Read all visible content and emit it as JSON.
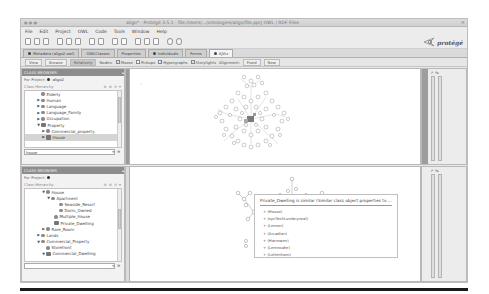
{
  "window": {
    "title": "aligo* · Protégé 3.5.1 · file:/Users/.../ontologies/aligo/file.pprj   OWL / RDF Files",
    "close_glyph": "×",
    "wm_buttons": "● ● ●"
  },
  "menubar": {
    "items": [
      "File",
      "Edit",
      "Project",
      "OWL",
      "Code",
      "Tools",
      "Window",
      "Help"
    ]
  },
  "toolbar": {
    "icons": [
      "new-file-icon",
      "open-folder-icon",
      "save-icon",
      "cut-icon",
      "copy-icon",
      "paste-icon",
      "undo-icon",
      "redo-icon",
      "find-icon",
      "find-next-icon",
      "class-icon",
      "property-icon",
      "individual-icon",
      "back-icon",
      "forward-icon"
    ],
    "logo_text": "protégé"
  },
  "tabs": [
    {
      "label": "Metadata (aligo2.owl)",
      "icon": true,
      "active": false
    },
    {
      "label": "OWLClasses",
      "icon": false,
      "active": false
    },
    {
      "label": "Properties",
      "icon": false,
      "active": false
    },
    {
      "label": "Individuals",
      "icon": true,
      "active": false
    },
    {
      "label": "Forms",
      "icon": false,
      "active": false
    },
    {
      "label": "AJViz",
      "icon": true,
      "active": true
    }
  ],
  "options": {
    "view_btn": "View",
    "browse_btn": "Browse",
    "relatively_btn": "Relatively",
    "nodes_label": "Nodes:",
    "checks": [
      {
        "label": "Moose",
        "checked": true
      },
      {
        "label": "Pickups",
        "checked": false
      },
      {
        "label": "Hypergraphs",
        "checked": true
      },
      {
        "label": "Storylights",
        "checked": true
      }
    ],
    "alignment_label": "Alignment:",
    "fixed_btn": "Fixed",
    "new_btn": "New"
  },
  "top_panel": {
    "header": "CLASS BROWSER",
    "project_label": "For Project:",
    "project_name": "aligo2",
    "hierarchy_label": "Class Hierarchy",
    "tree": [
      {
        "label": "Elderly",
        "depth": 1,
        "arrow": "",
        "selected": false,
        "defined": false
      },
      {
        "label": "Human",
        "depth": 1,
        "arrow": "▶",
        "selected": false,
        "defined": false
      },
      {
        "label": "Language",
        "depth": 1,
        "arrow": "▶",
        "selected": false,
        "defined": false
      },
      {
        "label": "Language_Family",
        "depth": 1,
        "arrow": "▶",
        "selected": false,
        "defined": false
      },
      {
        "label": "Occupation",
        "depth": 1,
        "arrow": "▶",
        "selected": false,
        "defined": false
      },
      {
        "label": "Property",
        "depth": 1,
        "arrow": "▼",
        "selected": false,
        "defined": true
      },
      {
        "label": "Commercial_property",
        "depth": 2,
        "arrow": "▶",
        "selected": false,
        "defined": false
      },
      {
        "label": "House",
        "depth": 2,
        "arrow": "▶",
        "selected": true,
        "defined": true
      }
    ],
    "search_value": "house"
  },
  "bottom_panel": {
    "header": "CLASS BROWSER",
    "project_label": "For Project:",
    "project_name": "",
    "hierarchy_label": "Class Hierarchy",
    "tree": [
      {
        "label": "House",
        "depth": 2,
        "arrow": "▼",
        "selected": false,
        "defined": false
      },
      {
        "label": "Apartment",
        "depth": 3,
        "arrow": "▼",
        "selected": false,
        "defined": false
      },
      {
        "label": "Seaside_Resort",
        "depth": 4,
        "arrow": "",
        "selected": false,
        "defined": false
      },
      {
        "label": "Dorm_Owned",
        "depth": 4,
        "arrow": "",
        "selected": false,
        "defined": false
      },
      {
        "label": "Multiple_House",
        "depth": 3,
        "arrow": "",
        "selected": false,
        "defined": false
      },
      {
        "label": "Private_Dwelling",
        "depth": 3,
        "arrow": "",
        "selected": false,
        "defined": true
      },
      {
        "label": "Rare_Room",
        "depth": 2,
        "arrow": "▶",
        "selected": false,
        "defined": false
      },
      {
        "label": "Lands",
        "depth": 1,
        "arrow": "▶",
        "selected": false,
        "defined": false
      },
      {
        "label": "Commercial_Property",
        "depth": 1,
        "arrow": "▼",
        "selected": false,
        "defined": false
      },
      {
        "label": "Storefront",
        "depth": 2,
        "arrow": "",
        "selected": false,
        "defined": false
      },
      {
        "label": "Commercial_Dwelling",
        "depth": 2,
        "arrow": "▼",
        "selected": false,
        "defined": true
      }
    ],
    "search_value": ""
  },
  "tooltip": {
    "title": "Private_Dwelling is similar (Similar class object properties to ... 1.0)",
    "rows": [
      "+ (House)",
      "+ (synTechLumbryneal)",
      "+ (Lemon)",
      "+ (Arcadian)",
      "+ (Harrowen)",
      "+ (Lemnoake)",
      "+ (Lottenham)"
    ]
  },
  "sliders": {
    "top_icons": [
      "zoom-in-icon",
      "zoom-out-icon"
    ],
    "bottom_icons": [
      "zoom-in-icon",
      "zoom-out-icon"
    ]
  }
}
